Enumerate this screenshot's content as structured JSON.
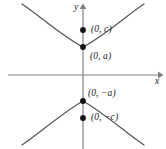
{
  "figure": {
    "background_color": "#ffffff",
    "curve_color": "#595959",
    "axis_color": "#808080",
    "point_color": "#111111",
    "label_color": "#1a1a1a"
  },
  "axes": {
    "x_label": "x",
    "y_label": "y",
    "origin": {
      "x": 83,
      "y": 75
    },
    "x_axis": {
      "start_x": 8,
      "end_x": 160,
      "y": 75,
      "arrow": "right"
    },
    "y_axis": {
      "x": 83,
      "start_y": 149,
      "end_y": 6,
      "arrow": "up"
    }
  },
  "points": [
    {
      "name": "focus-upper",
      "label": "(0, c)",
      "x": 83,
      "y": 30,
      "value": "c"
    },
    {
      "name": "vertex-upper",
      "label": "(0, a)",
      "x": 83,
      "y": 47,
      "value": "a"
    },
    {
      "name": "vertex-lower",
      "label": "(0, −a)",
      "x": 83,
      "y": 101,
      "value": "-a"
    },
    {
      "name": "focus-lower",
      "label": "(0, −c)",
      "x": 83,
      "y": 118,
      "value": "-c"
    }
  ],
  "curves": {
    "upper_branch": "M 22,4 C 40,16 62,36 83,47 C 104,36 126,16 144,4",
    "lower_branch": "M 22,145 C 40,133 62,113 83,101 C 104,113 126,133 144,145"
  },
  "chart_data": {
    "type": "line",
    "xlabel": "x",
    "ylabel": "y",
    "grid": false,
    "legend": "none",
    "annotations": [
      "(0, c)",
      "(0, a)",
      "(0, −a)",
      "(0, −c)"
    ],
    "series": [
      {
        "name": "upper branch",
        "description": "opens upward, vertex at (0, a)"
      },
      {
        "name": "lower branch",
        "description": "opens downward, vertex at (0, −a)"
      }
    ],
    "key_points": [
      {
        "label": "(0, c)",
        "role": "focus"
      },
      {
        "label": "(0, a)",
        "role": "vertex"
      },
      {
        "label": "(0, −a)",
        "role": "vertex"
      },
      {
        "label": "(0, −c)",
        "role": "focus"
      }
    ]
  }
}
